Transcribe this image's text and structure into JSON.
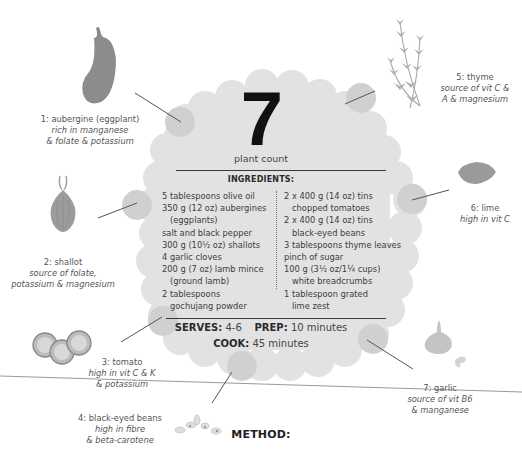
{
  "plant_count": {
    "number": "7",
    "label": "plant count"
  },
  "ingredients": {
    "title": "INGREDIENTS:",
    "left": [
      {
        "text": "5 tablespoons olive oil",
        "indent": false
      },
      {
        "text": "350 g (12 oz) aubergines",
        "indent": false
      },
      {
        "text": "(eggplants)",
        "indent": true
      },
      {
        "text": "salt and black pepper",
        "indent": false
      },
      {
        "text": "300 g (10½ oz) shallots",
        "indent": false
      },
      {
        "text": "4 garlic cloves",
        "indent": false
      },
      {
        "text": "200 g (7 oz) lamb mince",
        "indent": false
      },
      {
        "text": "(ground lamb)",
        "indent": true
      },
      {
        "text": "2 tablespoons",
        "indent": false
      },
      {
        "text": "gochujang powder",
        "indent": true
      }
    ],
    "right": [
      {
        "text": "2 x 400 g (14 oz) tins",
        "indent": false
      },
      {
        "text": "chopped tomatoes",
        "indent": true
      },
      {
        "text": "2 x 400 g (14 oz) tins",
        "indent": false
      },
      {
        "text": "black-eyed beans",
        "indent": true
      },
      {
        "text": "3 tablespoons thyme leaves",
        "indent": false
      },
      {
        "text": "pinch of sugar",
        "indent": false
      },
      {
        "text": "100 g (3½ oz/1¼ cups)",
        "indent": false
      },
      {
        "text": "white breadcrumbs",
        "indent": true
      },
      {
        "text": "1 tablespoon grated",
        "indent": false
      },
      {
        "text": "lime zest",
        "indent": true
      }
    ]
  },
  "meta": {
    "serves_label": "SERVES:",
    "serves_value": "4-6",
    "prep_label": "PREP:",
    "prep_value": "10 minutes",
    "cook_label": "COOK:",
    "cook_value": "45 minutes"
  },
  "plants": [
    {
      "name": "1: aubergine (eggplant)",
      "note1": "rich in manganese",
      "note2": "& folate & potassium",
      "icon": "aubergine-icon"
    },
    {
      "name": "2: shallot",
      "note1": "source of folate,",
      "note2": "potassium & magnesium",
      "icon": "shallot-icon"
    },
    {
      "name": "3: tomato",
      "note1": "high in vit C & K",
      "note2": "& potassium",
      "icon": "tomato-slices-icon"
    },
    {
      "name": "4: black-eyed beans",
      "note1": "high in fibre",
      "note2": "& beta-carotene",
      "icon": "beans-icon"
    },
    {
      "name": "5: thyme",
      "note1": "source of vit C &",
      "note2": "A & magnesium",
      "icon": "thyme-icon"
    },
    {
      "name": "6: lime",
      "note1": "high in vit C",
      "note2": "",
      "icon": "lime-icon"
    },
    {
      "name": "7: garlic",
      "note1": "source of vit B6",
      "note2": "& manganese",
      "icon": "garlic-icon"
    }
  ],
  "method": {
    "title": "METHOD:"
  },
  "colors": {
    "blob": "#e2e2e2",
    "blob_highlight": "#d0d0d0",
    "illustration": "#9a9a9a",
    "text": "#3a3a3a"
  }
}
